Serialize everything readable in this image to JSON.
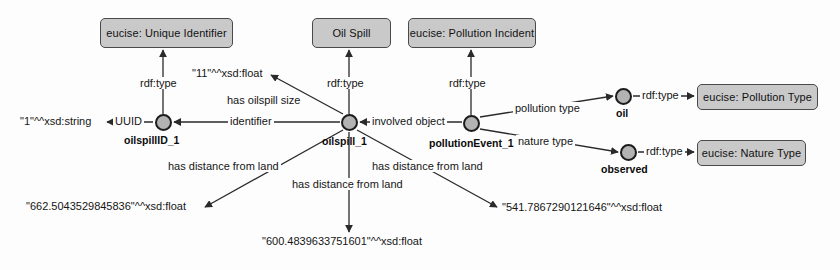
{
  "diagram": {
    "type": "rdf-graph",
    "colors": {
      "class_box_fill": "#c9c9c9",
      "class_box_stroke": "#4a4a4a",
      "node_fill": "#b3b3b3",
      "node_stroke": "#1c1c1c",
      "edge": "#2a2a2a",
      "background": "#fdfdfd"
    }
  },
  "class_boxes": [
    {
      "id": "unique_identifier",
      "label": "eucise: Unique Identifier"
    },
    {
      "id": "oil_spill",
      "label": "Oil Spill"
    },
    {
      "id": "pollution_incident",
      "label": "eucise: Pollution Incident"
    },
    {
      "id": "pollution_type",
      "label": "eucise: Pollution Type"
    },
    {
      "id": "nature_type",
      "label": "eucise: Nature Type"
    }
  ],
  "nodes": [
    {
      "id": "oilspillID_1",
      "label": "oilspillID_1"
    },
    {
      "id": "oilspill_1",
      "label": "oilspill_1"
    },
    {
      "id": "pollutionEvent_1",
      "label": "pollutionEvent_1"
    },
    {
      "id": "oil",
      "label": "oil"
    },
    {
      "id": "observed",
      "label": "observed"
    }
  ],
  "literals": [
    {
      "id": "lit_uuid",
      "label": "\"1\"^^xsd:string"
    },
    {
      "id": "lit_size",
      "label": "\"11\"^^xsd:float"
    },
    {
      "id": "lit_d1",
      "label": "\"662.5043529845836\"^^xsd:float"
    },
    {
      "id": "lit_d2",
      "label": "\"600.4839633751601\"^^xsd:float"
    },
    {
      "id": "lit_d3",
      "label": "\"541.7867290121646\"^^xsd:float"
    }
  ],
  "predicates": [
    {
      "id": "p_rdftype_1",
      "label": "rdf:type"
    },
    {
      "id": "p_rdftype_2",
      "label": "rdf:type"
    },
    {
      "id": "p_rdftype_3",
      "label": "rdf:type"
    },
    {
      "id": "p_rdftype_4",
      "label": "rdf:type"
    },
    {
      "id": "p_rdftype_5",
      "label": "rdf:type"
    },
    {
      "id": "p_uuid",
      "label": "UUID"
    },
    {
      "id": "p_identifier",
      "label": "identifier"
    },
    {
      "id": "p_size",
      "label": "has oilspill size"
    },
    {
      "id": "p_involved",
      "label": "involved object"
    },
    {
      "id": "p_polltype",
      "label": "pollution type"
    },
    {
      "id": "p_naturetype",
      "label": "nature type"
    },
    {
      "id": "p_dist_1",
      "label": "has distance from land"
    },
    {
      "id": "p_dist_2",
      "label": "has distance from land"
    },
    {
      "id": "p_dist_3",
      "label": "has distance from land"
    }
  ]
}
